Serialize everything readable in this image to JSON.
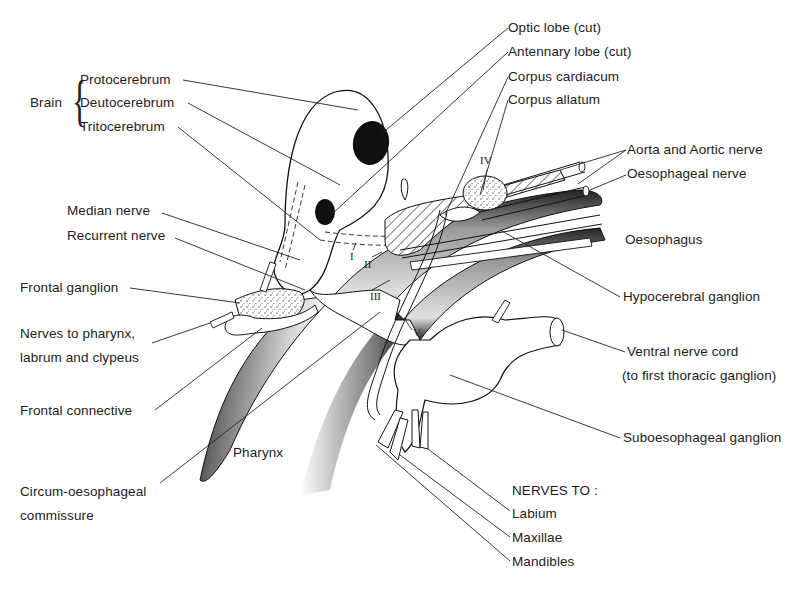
{
  "diagram": {
    "brain_group": {
      "label": "Brain",
      "parts": [
        "Protocerebrum",
        "Deutocerebrum",
        "Tritocerebrum"
      ]
    },
    "labels_left": {
      "median_nerve": "Median nerve",
      "recurrent_nerve": "Recurrent nerve",
      "frontal_ganglion": "Frontal ganglion",
      "nerves_to_pharynx_1": "Nerves to pharynx,",
      "nerves_to_pharynx_2": "labrum and clypeus",
      "frontal_connective": "Frontal connective",
      "circum_1": "Circum-oesophageal",
      "circum_2": "commissure"
    },
    "labels_top_right": {
      "optic_lobe": "Optic lobe  (cut)",
      "antennary_lobe": "Antennary lobe  (cut)",
      "corpus_cardiacum": "Corpus cardiacum",
      "corpus_allatum": "Corpus allatum"
    },
    "labels_right": {
      "aorta": "Aorta and Aortic nerve",
      "oesophageal_nerve": "Oesophageal nerve",
      "oesophagus": "Oesophagus",
      "hypocerebral_ganglion": "Hypocerebral ganglion",
      "ventral_nerve_cord_1": "Ventral nerve cord",
      "ventral_nerve_cord_2": "(to first thoracic ganglion)",
      "suboesophageal_ganglion": "Suboesophageal ganglion"
    },
    "labels_inside": {
      "pharynx": "Pharynx"
    },
    "nerves_to": {
      "heading": "NERVES TO :",
      "items": [
        "Labium",
        "Maxillae",
        "Mandibles"
      ]
    },
    "roman_numerals": [
      "I",
      "II",
      "III",
      "IV",
      "V"
    ]
  }
}
